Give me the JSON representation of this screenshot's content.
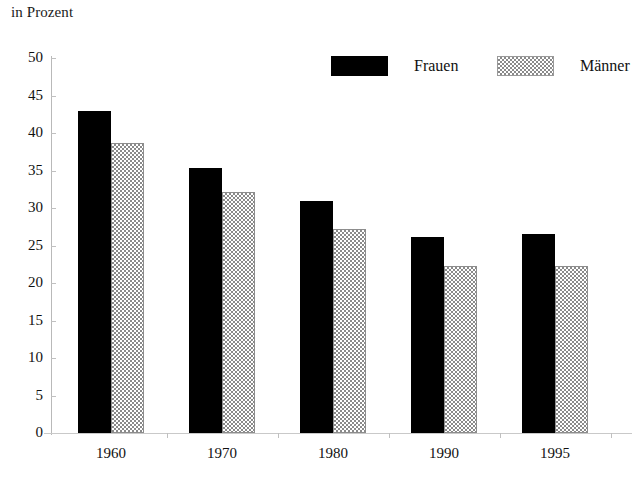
{
  "chart_data": {
    "type": "bar",
    "title": "in Prozent",
    "xlabel": "",
    "ylabel": "",
    "ylim": [
      0,
      50
    ],
    "yticks": [
      0,
      5,
      10,
      15,
      20,
      25,
      30,
      35,
      40,
      45,
      50
    ],
    "grid": false,
    "legend_position": "top-right",
    "categories": [
      "1960",
      "1970",
      "1980",
      "1990",
      "1995"
    ],
    "series": [
      {
        "name": "Frauen",
        "color": "#000000",
        "pattern": "solid",
        "values": [
          43.0,
          35.4,
          31.0,
          26.1,
          26.6
        ]
      },
      {
        "name": "Männer",
        "color": "#8a8a8a",
        "pattern": "checkered",
        "values": [
          38.7,
          32.1,
          27.2,
          22.3,
          22.3
        ]
      }
    ]
  },
  "axis": {
    "y_tick_labels": [
      "50",
      "45",
      "40",
      "35",
      "30",
      "25",
      "20",
      "15",
      "10",
      "5",
      "0"
    ],
    "x_tick_labels": [
      "1960",
      "1970",
      "1980",
      "1990",
      "1995"
    ]
  },
  "legend": {
    "items": [
      {
        "label": "Frauen",
        "swatch": "black-solid-swatch"
      },
      {
        "label": "Männer",
        "swatch": "grey-checkered-swatch"
      }
    ]
  }
}
